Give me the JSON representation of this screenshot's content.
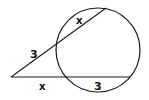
{
  "diagram": {
    "type": "two-secants-circle",
    "colors": {
      "stroke": "#1a1a1a",
      "background": "#ffffff"
    },
    "circle": {
      "cx": 98,
      "cy": 50,
      "r": 42
    },
    "external_point": {
      "x": 11,
      "y": 77
    },
    "secant_upper": {
      "x2": 106,
      "y2": 8
    },
    "secant_lower": {
      "x2": 130,
      "y2": 77
    },
    "labels": {
      "upper_external": "3",
      "upper_internal": "x",
      "lower_external": "x",
      "lower_internal": "3"
    }
  }
}
